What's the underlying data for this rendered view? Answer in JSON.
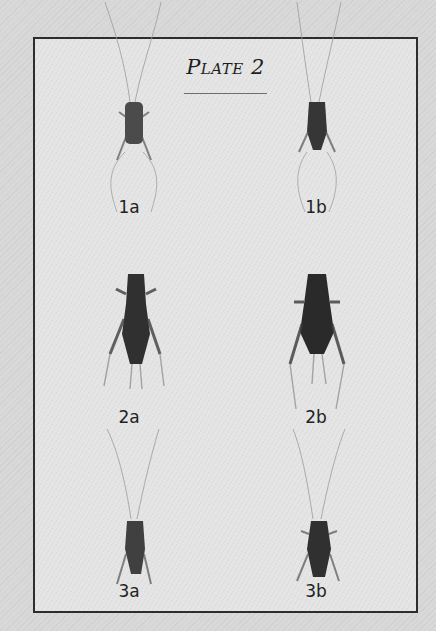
{
  "plate": {
    "title": "Plate 2",
    "border_color": "#2d2d2d",
    "background_color": "#e4e4e4"
  },
  "figures": [
    {
      "label": "1a",
      "column": "left",
      "row": 1,
      "subject": "cricket-specimen"
    },
    {
      "label": "1b",
      "column": "right",
      "row": 1,
      "subject": "cricket-specimen"
    },
    {
      "label": "2a",
      "column": "left",
      "row": 2,
      "subject": "cricket-specimen"
    },
    {
      "label": "2b",
      "column": "right",
      "row": 2,
      "subject": "cricket-specimen"
    },
    {
      "label": "3a",
      "column": "left",
      "row": 3,
      "subject": "cricket-specimen"
    },
    {
      "label": "3b",
      "column": "right",
      "row": 3,
      "subject": "cricket-specimen"
    }
  ]
}
